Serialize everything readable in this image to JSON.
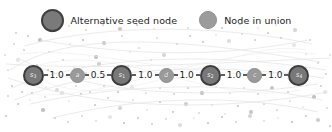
{
  "figure": {
    "width": 332,
    "height": 132,
    "background_color": "#ffffff"
  },
  "legend": {
    "entries": [
      {
        "label": "Alternative seed node",
        "marker_name": "seed-node-marker-icon",
        "fill_color": "#7a7a7a",
        "border_color": "#3f3f3f",
        "size": "large"
      },
      {
        "label": "Node in union",
        "marker_name": "union-node-marker-icon",
        "fill_color": "#9b9b9b",
        "border_color": "#8e8e8e",
        "size": "small"
      }
    ]
  },
  "chart_data": {
    "type": "diagram",
    "title": "",
    "nodes": [
      {
        "id": "s3",
        "label": "s",
        "subscript": "3",
        "kind": "seed"
      },
      {
        "id": "a",
        "label": "a",
        "subscript": "",
        "kind": "union"
      },
      {
        "id": "s1",
        "label": "s",
        "subscript": "1",
        "kind": "seed"
      },
      {
        "id": "d",
        "label": "d",
        "subscript": "",
        "kind": "union"
      },
      {
        "id": "s2",
        "label": "s",
        "subscript": "2",
        "kind": "seed"
      },
      {
        "id": "c",
        "label": "c",
        "subscript": "",
        "kind": "union"
      },
      {
        "id": "s4",
        "label": "s",
        "subscript": "4",
        "kind": "seed"
      }
    ],
    "edges": [
      {
        "source": "s3",
        "target": "a",
        "weight": "1.0"
      },
      {
        "source": "a",
        "target": "s1",
        "weight": "0.5"
      },
      {
        "source": "s1",
        "target": "d",
        "weight": "1.0"
      },
      {
        "source": "d",
        "target": "s2",
        "weight": "1.0"
      },
      {
        "source": "s2",
        "target": "c",
        "weight": "1.0"
      },
      {
        "source": "c",
        "target": "s4",
        "weight": "1.0"
      }
    ],
    "colors": {
      "seed_fill": "#787878",
      "seed_border": "#3c3c3c",
      "union_fill": "#9a9a9a",
      "union_border": "#8b8b8b",
      "edge": "#5d5d5d",
      "weight_text": "#1c1c1c",
      "background_point": "#b6b6b6"
    }
  },
  "background": {
    "points": [
      [
        70,
        44
      ],
      [
        83,
        40
      ],
      [
        104,
        43
      ],
      [
        122,
        36
      ],
      [
        139,
        48
      ],
      [
        157,
        38
      ],
      [
        130,
        52
      ],
      [
        96,
        57
      ],
      [
        63,
        60
      ],
      [
        49,
        52
      ],
      [
        37,
        65
      ],
      [
        26,
        72
      ],
      [
        18,
        60
      ],
      [
        12,
        86
      ],
      [
        22,
        92
      ],
      [
        33,
        84
      ],
      [
        45,
        97
      ],
      [
        57,
        90
      ],
      [
        69,
        101
      ],
      [
        81,
        94
      ],
      [
        95,
        105
      ],
      [
        108,
        98
      ],
      [
        120,
        108
      ],
      [
        133,
        100
      ],
      [
        147,
        110
      ],
      [
        160,
        102
      ],
      [
        173,
        112
      ],
      [
        186,
        104
      ],
      [
        199,
        113
      ],
      [
        212,
        105
      ],
      [
        225,
        114
      ],
      [
        238,
        106
      ],
      [
        251,
        112
      ],
      [
        264,
        104
      ],
      [
        277,
        110
      ],
      [
        290,
        101
      ],
      [
        303,
        107
      ],
      [
        314,
        97
      ],
      [
        321,
        86
      ],
      [
        326,
        74
      ],
      [
        318,
        63
      ],
      [
        306,
        54
      ],
      [
        294,
        45
      ],
      [
        281,
        38
      ],
      [
        268,
        33
      ],
      [
        255,
        40
      ],
      [
        242,
        34
      ],
      [
        229,
        41
      ],
      [
        216,
        35
      ],
      [
        203,
        42
      ],
      [
        190,
        36
      ],
      [
        177,
        44
      ],
      [
        164,
        55
      ],
      [
        151,
        60
      ],
      [
        143,
        72
      ],
      [
        128,
        66
      ],
      [
        113,
        71
      ],
      [
        99,
        64
      ],
      [
        86,
        73
      ],
      [
        74,
        68
      ],
      [
        61,
        76
      ],
      [
        48,
        70
      ],
      [
        35,
        78
      ],
      [
        24,
        50
      ],
      [
        14,
        44
      ],
      [
        8,
        70
      ],
      [
        30,
        100
      ],
      [
        43,
        110
      ],
      [
        55,
        118
      ],
      [
        68,
        122
      ],
      [
        82,
        116
      ],
      [
        96,
        121
      ],
      [
        110,
        117
      ],
      [
        124,
        123
      ],
      [
        138,
        118
      ],
      [
        152,
        124
      ],
      [
        166,
        119
      ],
      [
        180,
        125
      ],
      [
        194,
        118
      ],
      [
        208,
        123
      ],
      [
        222,
        117
      ],
      [
        236,
        122
      ],
      [
        250,
        116
      ],
      [
        264,
        121
      ],
      [
        278,
        118
      ],
      [
        292,
        122
      ],
      [
        306,
        116
      ],
      [
        318,
        120
      ],
      [
        327,
        108
      ],
      [
        5,
        55
      ],
      [
        300,
        86
      ],
      [
        288,
        92
      ],
      [
        272,
        88
      ],
      [
        258,
        94
      ],
      [
        244,
        88
      ],
      [
        230,
        93
      ],
      [
        216,
        87
      ],
      [
        202,
        93
      ],
      [
        188,
        88
      ],
      [
        174,
        94
      ],
      [
        160,
        88
      ],
      [
        146,
        93
      ],
      [
        132,
        87
      ],
      [
        118,
        92
      ],
      [
        104,
        86
      ],
      [
        90,
        92
      ],
      [
        76,
        86
      ],
      [
        62,
        93
      ],
      [
        46,
        87
      ],
      [
        32,
        93
      ],
      [
        18,
        104
      ],
      [
        310,
        40
      ],
      [
        295,
        30
      ],
      [
        276,
        25
      ],
      [
        258,
        28
      ],
      [
        240,
        24
      ],
      [
        222,
        28
      ],
      [
        205,
        24
      ],
      [
        188,
        28
      ],
      [
        171,
        24
      ],
      [
        154,
        29
      ],
      [
        137,
        25
      ],
      [
        120,
        29
      ],
      [
        103,
        25
      ],
      [
        86,
        30
      ],
      [
        69,
        26
      ],
      [
        52,
        32
      ],
      [
        40,
        40
      ],
      [
        28,
        36
      ],
      [
        16,
        33
      ],
      [
        8,
        96
      ],
      [
        330,
        55
      ],
      [
        325,
        92
      ],
      [
        6,
        116
      ],
      [
        330,
        126
      ]
    ]
  }
}
